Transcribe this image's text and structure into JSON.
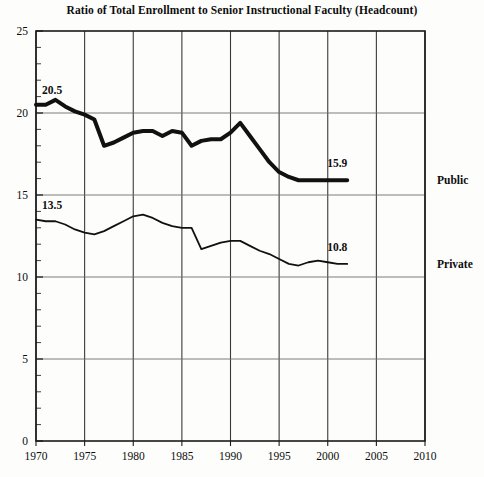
{
  "chart_data": {
    "type": "line",
    "title": "Ratio of Total Enrollment to Senior Instructional Faculty (Headcount)",
    "xlabel": "",
    "ylabel": "",
    "xlim": [
      1970,
      2010
    ],
    "ylim": [
      0,
      25
    ],
    "grid": true,
    "legend_position": "right-inline",
    "x_ticks": [
      "1970",
      "1975",
      "1980",
      "1985",
      "1990",
      "1995",
      "2000",
      "2005",
      "2010"
    ],
    "y_ticks": [
      "0",
      "5",
      "10",
      "15",
      "20",
      "25"
    ],
    "annotations": [
      {
        "text": "20.5",
        "series": "Public",
        "anchor": "start"
      },
      {
        "text": "15.9",
        "series": "Public",
        "anchor": "end"
      },
      {
        "text": "13.5",
        "series": "Private",
        "anchor": "start"
      },
      {
        "text": "10.8",
        "series": "Private",
        "anchor": "end"
      }
    ],
    "series": [
      {
        "name": "Public",
        "label": "Public",
        "color": "#111111",
        "line_width": 4,
        "x": [
          1970,
          1971,
          1972,
          1973,
          1974,
          1975,
          1976,
          1977,
          1978,
          1979,
          1980,
          1981,
          1982,
          1983,
          1984,
          1985,
          1986,
          1987,
          1988,
          1989,
          1990,
          1991,
          1992,
          1993,
          1994,
          1995,
          1996,
          1997,
          1998,
          1999,
          2000,
          2001,
          2002
        ],
        "values": [
          20.5,
          20.5,
          20.8,
          20.4,
          20.1,
          19.9,
          19.6,
          18.0,
          18.2,
          18.5,
          18.8,
          18.9,
          18.9,
          18.6,
          18.9,
          18.8,
          18.0,
          18.3,
          18.4,
          18.4,
          18.8,
          19.4,
          18.6,
          17.8,
          17.0,
          16.4,
          16.1,
          15.9,
          15.9,
          15.9,
          15.9,
          15.9,
          15.9
        ]
      },
      {
        "name": "Private",
        "label": "Private",
        "color": "#111111",
        "line_width": 1.8,
        "x": [
          1970,
          1971,
          1972,
          1973,
          1974,
          1975,
          1976,
          1977,
          1978,
          1979,
          1980,
          1981,
          1982,
          1983,
          1984,
          1985,
          1986,
          1987,
          1988,
          1989,
          1990,
          1991,
          1992,
          1993,
          1994,
          1995,
          1996,
          1997,
          1998,
          1999,
          2000,
          2001,
          2002
        ],
        "values": [
          13.5,
          13.4,
          13.4,
          13.2,
          12.9,
          12.7,
          12.6,
          12.8,
          13.1,
          13.4,
          13.7,
          13.8,
          13.6,
          13.3,
          13.1,
          13.0,
          13.0,
          11.7,
          11.9,
          12.1,
          12.2,
          12.2,
          11.9,
          11.6,
          11.4,
          11.1,
          10.8,
          10.7,
          10.9,
          11.0,
          10.9,
          10.8,
          10.8
        ]
      }
    ]
  }
}
